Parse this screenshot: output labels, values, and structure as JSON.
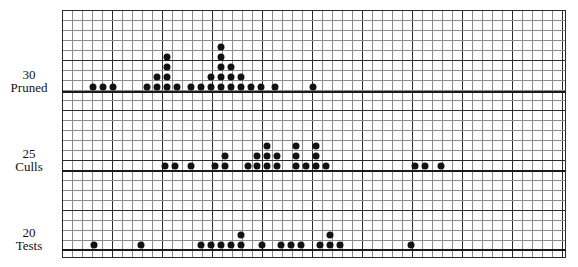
{
  "figure": {
    "type": "dot-plot-triple"
  },
  "rows": [
    {
      "id": "pruned",
      "value_label": "30",
      "name_label": "Pruned"
    },
    {
      "id": "culls",
      "value_label": "25",
      "name_label": "Culls"
    },
    {
      "id": "tests",
      "value_label": "20",
      "name_label": "Tests"
    }
  ],
  "chart_data": {
    "type": "scatter",
    "title": "",
    "xlabel": "",
    "ylabel": "",
    "grid": true,
    "legend": "none",
    "axis_tick_labels": [
      "30",
      "25",
      "20"
    ],
    "series": [
      {
        "name": "Pruned",
        "baseline_label": "30 Pruned",
        "stacks": [
          {
            "x": 93,
            "count": 1
          },
          {
            "x": 103,
            "count": 1
          },
          {
            "x": 113,
            "count": 1
          },
          {
            "x": 147,
            "count": 1
          },
          {
            "x": 157,
            "count": 2
          },
          {
            "x": 167,
            "count": 4
          },
          {
            "x": 177,
            "count": 1
          },
          {
            "x": 191,
            "count": 1
          },
          {
            "x": 201,
            "count": 1
          },
          {
            "x": 211,
            "count": 2
          },
          {
            "x": 221,
            "count": 5
          },
          {
            "x": 231,
            "count": 3
          },
          {
            "x": 241,
            "count": 2
          },
          {
            "x": 251,
            "count": 1
          },
          {
            "x": 261,
            "count": 1
          },
          {
            "x": 275,
            "count": 1
          },
          {
            "x": 313,
            "count": 1
          }
        ]
      },
      {
        "name": "Culls",
        "baseline_label": "25 Culls",
        "stacks": [
          {
            "x": 165,
            "count": 1
          },
          {
            "x": 175,
            "count": 1
          },
          {
            "x": 191,
            "count": 1
          },
          {
            "x": 215,
            "count": 1
          },
          {
            "x": 225,
            "count": 2
          },
          {
            "x": 248,
            "count": 1
          },
          {
            "x": 257,
            "count": 2
          },
          {
            "x": 267,
            "count": 3
          },
          {
            "x": 277,
            "count": 2
          },
          {
            "x": 296,
            "count": 3
          },
          {
            "x": 306,
            "count": 1
          },
          {
            "x": 316,
            "count": 3
          },
          {
            "x": 326,
            "count": 1
          },
          {
            "x": 415,
            "count": 1
          },
          {
            "x": 425,
            "count": 1
          },
          {
            "x": 441,
            "count": 1
          }
        ]
      },
      {
        "name": "Tests",
        "baseline_label": "20 Tests",
        "stacks": [
          {
            "x": 94,
            "count": 1
          },
          {
            "x": 141,
            "count": 1
          },
          {
            "x": 201,
            "count": 1
          },
          {
            "x": 211,
            "count": 1
          },
          {
            "x": 221,
            "count": 1
          },
          {
            "x": 231,
            "count": 1
          },
          {
            "x": 241,
            "count": 2
          },
          {
            "x": 262,
            "count": 1
          },
          {
            "x": 281,
            "count": 1
          },
          {
            "x": 291,
            "count": 1
          },
          {
            "x": 301,
            "count": 1
          },
          {
            "x": 320,
            "count": 1
          },
          {
            "x": 330,
            "count": 2
          },
          {
            "x": 340,
            "count": 1
          },
          {
            "x": 411,
            "count": 1
          }
        ]
      }
    ]
  },
  "colors": {
    "dot": "#121212",
    "grid_minor": "#8c8c8c",
    "grid_major": "#2b2b2b",
    "baseline": "#1a1a1a",
    "background": "#ffffff"
  }
}
